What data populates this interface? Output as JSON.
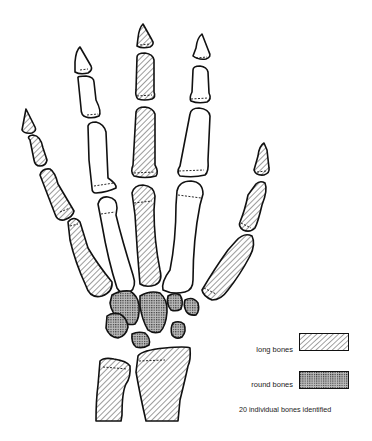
{
  "figure": {
    "colors": {
      "stroke": "#111111",
      "background": "#ffffff",
      "text": "#222222"
    }
  },
  "legend": {
    "items": [
      {
        "label": "long bones",
        "pattern": "diagonal-hatch"
      },
      {
        "label": "round bones",
        "pattern": "cross-dot"
      }
    ],
    "caption": "20 individual bones identified"
  }
}
